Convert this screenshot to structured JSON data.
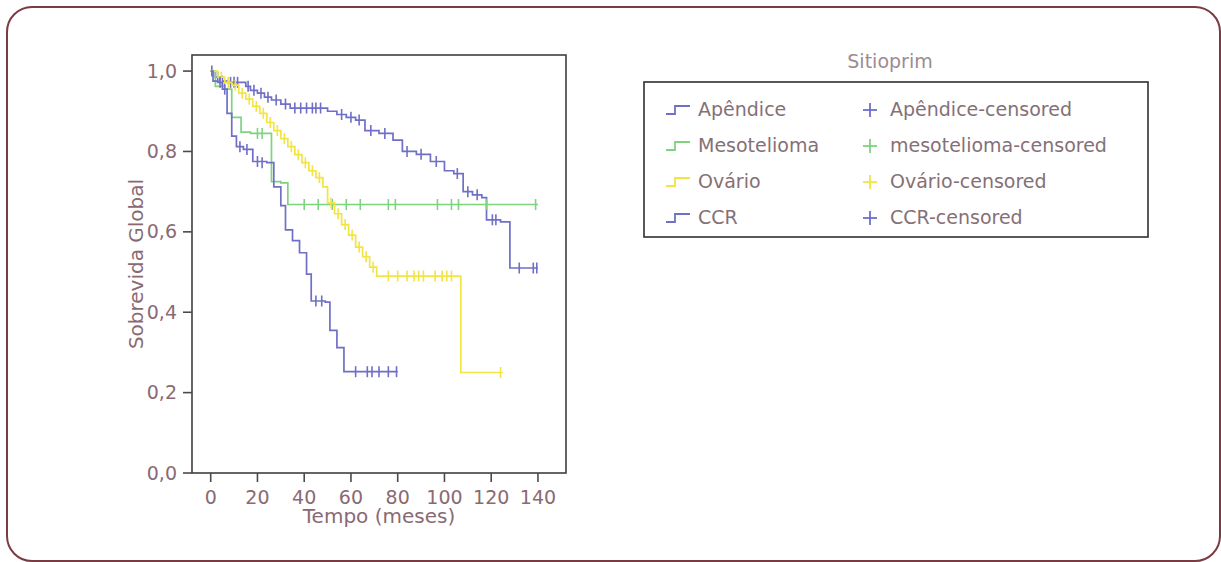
{
  "frame": {
    "border_color": "#7b3b42",
    "corner_radius": 26
  },
  "chart_data": {
    "type": "line",
    "subtype": "kaplan-meier-survival-step",
    "title": "",
    "xlabel": "Tempo (meses)",
    "ylabel": "Sobrevida Global",
    "xlim": [
      -8,
      152
    ],
    "ylim": [
      0.0,
      1.04
    ],
    "xticks": [
      0,
      20,
      40,
      60,
      80,
      100,
      120,
      140
    ],
    "xtick_labels": [
      "0",
      "20",
      "40",
      "60",
      "80",
      "100",
      "120",
      "140"
    ],
    "yticks": [
      0.0,
      0.2,
      0.4,
      0.6,
      0.8,
      1.0
    ],
    "ytick_labels": [
      "0,0",
      "0,2",
      "0,4",
      "0,6",
      "0,8",
      "1,0"
    ],
    "grid": false,
    "legend_position": "right-outside",
    "legend_title": "Sitioprim",
    "axis_color": "#4a4a4a",
    "text_color": "#8a6a72",
    "series": [
      {
        "name": "Apêndice",
        "color": "#6f6fc8",
        "legend_key": "apendice",
        "censored_name": "Apêndice-censored",
        "censored_color": "#6f6fc8",
        "steps": [
          [
            0,
            1.0
          ],
          [
            2,
            0.985
          ],
          [
            4,
            0.975
          ],
          [
            7,
            0.972
          ],
          [
            12,
            0.972
          ],
          [
            15,
            0.962
          ],
          [
            17,
            0.952
          ],
          [
            20,
            0.945
          ],
          [
            23,
            0.935
          ],
          [
            26,
            0.928
          ],
          [
            30,
            0.918
          ],
          [
            34,
            0.908
          ],
          [
            46,
            0.908
          ],
          [
            50,
            0.9
          ],
          [
            54,
            0.892
          ],
          [
            58,
            0.885
          ],
          [
            62,
            0.878
          ],
          [
            66,
            0.852
          ],
          [
            72,
            0.845
          ],
          [
            78,
            0.828
          ],
          [
            82,
            0.8
          ],
          [
            88,
            0.793
          ],
          [
            94,
            0.775
          ],
          [
            100,
            0.752
          ],
          [
            104,
            0.745
          ],
          [
            108,
            0.7
          ],
          [
            112,
            0.692
          ],
          [
            116,
            0.685
          ],
          [
            118,
            0.63
          ],
          [
            124,
            0.625
          ],
          [
            128,
            0.51
          ],
          [
            140,
            0.51
          ]
        ],
        "censored_points": [
          [
            0.5,
            1.0
          ],
          [
            3.0,
            0.985
          ],
          [
            5.0,
            0.975
          ],
          [
            8.5,
            0.972
          ],
          [
            10.0,
            0.972
          ],
          [
            11.5,
            0.972
          ],
          [
            16.0,
            0.962
          ],
          [
            18.5,
            0.952
          ],
          [
            21.5,
            0.945
          ],
          [
            24.5,
            0.935
          ],
          [
            28.0,
            0.928
          ],
          [
            32.0,
            0.918
          ],
          [
            36.0,
            0.908
          ],
          [
            38.5,
            0.908
          ],
          [
            41.0,
            0.908
          ],
          [
            43.5,
            0.908
          ],
          [
            45.0,
            0.908
          ],
          [
            47.0,
            0.908
          ],
          [
            56.0,
            0.892
          ],
          [
            60.0,
            0.885
          ],
          [
            63.5,
            0.878
          ],
          [
            68.5,
            0.852
          ],
          [
            74.5,
            0.845
          ],
          [
            84.0,
            0.8
          ],
          [
            90.0,
            0.793
          ],
          [
            96.5,
            0.775
          ],
          [
            105.5,
            0.745
          ],
          [
            110.0,
            0.7
          ],
          [
            114.0,
            0.692
          ],
          [
            120.5,
            0.63
          ],
          [
            122.0,
            0.63
          ],
          [
            132.0,
            0.51
          ],
          [
            138.0,
            0.51
          ],
          [
            139.5,
            0.51
          ]
        ]
      },
      {
        "name": "Mesotelioma",
        "color": "#7ed47e",
        "legend_key": "mesotelioma",
        "censored_name": "mesotelioma-censored",
        "censored_color": "#7ed47e",
        "steps": [
          [
            0,
            1.0
          ],
          [
            2,
            0.962
          ],
          [
            6,
            0.955
          ],
          [
            9,
            0.885
          ],
          [
            13,
            0.848
          ],
          [
            17,
            0.845
          ],
          [
            24,
            0.845
          ],
          [
            26,
            0.725
          ],
          [
            30,
            0.722
          ],
          [
            33,
            0.668
          ],
          [
            140,
            0.668
          ]
        ],
        "censored_points": [
          [
            20.0,
            0.845
          ],
          [
            22.0,
            0.845
          ],
          [
            40.0,
            0.668
          ],
          [
            46.0,
            0.668
          ],
          [
            52.0,
            0.668
          ],
          [
            58.0,
            0.668
          ],
          [
            64.0,
            0.668
          ],
          [
            76.0,
            0.668
          ],
          [
            79.0,
            0.668
          ],
          [
            97.0,
            0.668
          ],
          [
            103.0,
            0.668
          ],
          [
            106.0,
            0.668
          ],
          [
            118.0,
            0.668
          ],
          [
            139.0,
            0.668
          ]
        ]
      },
      {
        "name": "Ovário",
        "color": "#f2e444",
        "legend_key": "ovario",
        "censored_name": "Ovário-censored",
        "censored_color": "#f2e444",
        "steps": [
          [
            0,
            1.0
          ],
          [
            3,
            0.985
          ],
          [
            6,
            0.972
          ],
          [
            9,
            0.965
          ],
          [
            12,
            0.945
          ],
          [
            15,
            0.93
          ],
          [
            18,
            0.912
          ],
          [
            21,
            0.895
          ],
          [
            24,
            0.872
          ],
          [
            27,
            0.852
          ],
          [
            30,
            0.832
          ],
          [
            33,
            0.812
          ],
          [
            36,
            0.792
          ],
          [
            39,
            0.772
          ],
          [
            42,
            0.752
          ],
          [
            45,
            0.735
          ],
          [
            48,
            0.712
          ],
          [
            50,
            0.672
          ],
          [
            53,
            0.645
          ],
          [
            56,
            0.618
          ],
          [
            59,
            0.592
          ],
          [
            62,
            0.562
          ],
          [
            65,
            0.538
          ],
          [
            68,
            0.512
          ],
          [
            71,
            0.49
          ],
          [
            105,
            0.49
          ],
          [
            107,
            0.25
          ],
          [
            125,
            0.25
          ]
        ],
        "censored_points": [
          [
            4.5,
            0.985
          ],
          [
            7.5,
            0.972
          ],
          [
            10.5,
            0.965
          ],
          [
            13.5,
            0.945
          ],
          [
            16.5,
            0.93
          ],
          [
            19.5,
            0.912
          ],
          [
            22.5,
            0.895
          ],
          [
            25.5,
            0.872
          ],
          [
            28.5,
            0.852
          ],
          [
            31.5,
            0.832
          ],
          [
            34.5,
            0.812
          ],
          [
            37.5,
            0.792
          ],
          [
            40.5,
            0.772
          ],
          [
            43.5,
            0.752
          ],
          [
            46.5,
            0.735
          ],
          [
            51.5,
            0.672
          ],
          [
            54.5,
            0.645
          ],
          [
            57.5,
            0.618
          ],
          [
            60.5,
            0.592
          ],
          [
            63.5,
            0.562
          ],
          [
            66.5,
            0.538
          ],
          [
            69.5,
            0.512
          ],
          [
            76.0,
            0.49
          ],
          [
            80.0,
            0.49
          ],
          [
            84.0,
            0.49
          ],
          [
            87.0,
            0.49
          ],
          [
            89.0,
            0.49
          ],
          [
            91.0,
            0.49
          ],
          [
            96.0,
            0.49
          ],
          [
            99.0,
            0.49
          ],
          [
            101.0,
            0.49
          ],
          [
            103.0,
            0.49
          ],
          [
            124.0,
            0.25
          ]
        ]
      },
      {
        "name": "CCR",
        "color": "#6f6fc8",
        "legend_key": "ccr",
        "censored_name": "CCR-censored",
        "censored_color": "#6f6fc8",
        "steps": [
          [
            0,
            1.0
          ],
          [
            1,
            0.975
          ],
          [
            3,
            0.972
          ],
          [
            5,
            0.955
          ],
          [
            7,
            0.895
          ],
          [
            9,
            0.838
          ],
          [
            11,
            0.812
          ],
          [
            14,
            0.805
          ],
          [
            18,
            0.775
          ],
          [
            24,
            0.772
          ],
          [
            27,
            0.712
          ],
          [
            30,
            0.665
          ],
          [
            32,
            0.605
          ],
          [
            35,
            0.578
          ],
          [
            38,
            0.548
          ],
          [
            41,
            0.495
          ],
          [
            43,
            0.428
          ],
          [
            49,
            0.425
          ],
          [
            51,
            0.355
          ],
          [
            54,
            0.312
          ],
          [
            57,
            0.252
          ],
          [
            80,
            0.252
          ]
        ],
        "censored_points": [
          [
            4.0,
            0.972
          ],
          [
            6.0,
            0.955
          ],
          [
            12.5,
            0.812
          ],
          [
            15.5,
            0.805
          ],
          [
            20.0,
            0.775
          ],
          [
            22.0,
            0.772
          ],
          [
            45.0,
            0.428
          ],
          [
            47.5,
            0.428
          ],
          [
            62.0,
            0.252
          ],
          [
            67.0,
            0.252
          ],
          [
            69.0,
            0.252
          ],
          [
            72.0,
            0.252
          ],
          [
            76.0,
            0.252
          ],
          [
            79.5,
            0.252
          ]
        ]
      }
    ]
  },
  "legend": {
    "title": "Sitioprim",
    "rows": [
      {
        "line_label": "Apêndice",
        "line_color": "#6f6fc8",
        "mark_label": "Apêndice-censored",
        "mark_color": "#6f6fc8"
      },
      {
        "line_label": "Mesotelioma",
        "line_color": "#7ed47e",
        "mark_label": "mesotelioma-censored",
        "mark_color": "#7ed47e"
      },
      {
        "line_label": "Ovário",
        "line_color": "#f2e444",
        "mark_label": "Ovário-censored",
        "mark_color": "#f2e444"
      },
      {
        "line_label": "CCR",
        "line_color": "#6f6fc8",
        "mark_label": "CCR-censored",
        "mark_color": "#6f6fc8"
      }
    ]
  }
}
